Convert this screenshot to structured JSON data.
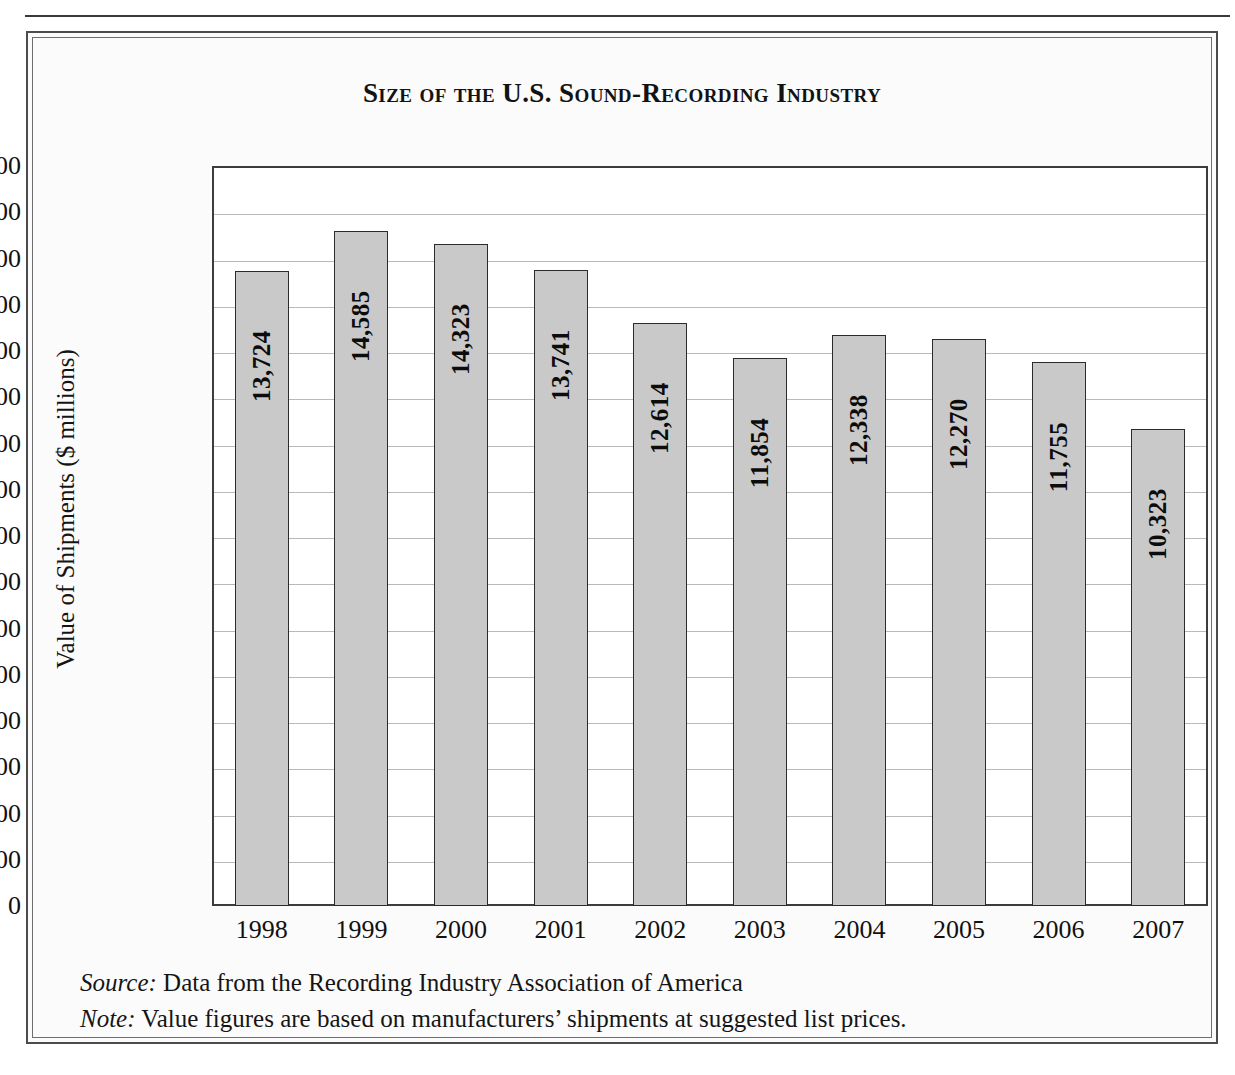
{
  "figure": {
    "title": "Size of the U.S. Sound-Recording Industry",
    "source_label": "Source:",
    "source_text": " Data from the Recording Industry Association of America",
    "note_label": "Note:",
    "note_text": " Value figures are based on manufacturers’ shipments at suggested list prices."
  },
  "chart_data": {
    "type": "bar",
    "title": "Size of the U.S. Sound-Recording Industry",
    "xlabel": "",
    "ylabel": "Value of Shipments ($ millions)",
    "categories": [
      "1998",
      "1999",
      "2000",
      "2001",
      "2002",
      "2003",
      "2004",
      "2005",
      "2006",
      "2007"
    ],
    "values": [
      13724,
      14585,
      14323,
      13741,
      12614,
      11854,
      12338,
      12270,
      11755,
      10323
    ],
    "value_labels": [
      "13,724",
      "14,585",
      "14,323",
      "13,741",
      "12,614",
      "11,854",
      "12,338",
      "12,270",
      "11,755",
      "10,323"
    ],
    "ylim": [
      0,
      16000
    ],
    "ytick_values": [
      16000,
      15000,
      14000,
      13000,
      12000,
      11000,
      10000,
      9000,
      8000,
      7000,
      6000,
      5000,
      4000,
      3000,
      2000,
      1000,
      0
    ],
    "ytick_labels": [
      "16,000",
      "15,000",
      "14,000",
      "13,000",
      "12,000",
      "11,000",
      "10,000",
      "9,000",
      "8,000",
      "7,000",
      "6,000",
      "5,000",
      "4,000",
      "3,000",
      "2,000",
      "1,000",
      "0"
    ],
    "grid": true,
    "legend": false,
    "bar_fill_color": "#c9c9c9",
    "bar_edge_color": "#2b2b2b",
    "gridline_color": "#b9b9b9",
    "label_orientation": "vertical-bottom-to-top"
  }
}
